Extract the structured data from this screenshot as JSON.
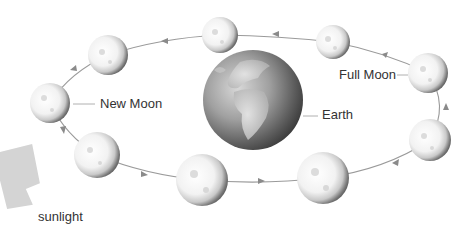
{
  "diagram": {
    "labels": {
      "new_moon": "New Moon",
      "full_moon": "Full Moon",
      "earth": "Earth",
      "sunlight": "sunlight"
    },
    "colors": {
      "background": "#ffffff",
      "orbit_line": "#9a9a9a",
      "sunlight_arrow": "#d4d4d4",
      "text": "#333333",
      "leader_line": "#b0b0b0"
    },
    "earth": {
      "cx": 253,
      "cy": 100,
      "r": 50
    },
    "moons": [
      {
        "id": "new-moon",
        "cx": 50,
        "cy": 103,
        "r": 20
      },
      {
        "id": "moon-2",
        "cx": 108,
        "cy": 55,
        "r": 20
      },
      {
        "id": "moon-3",
        "cx": 220,
        "cy": 35,
        "r": 18
      },
      {
        "id": "moon-4",
        "cx": 333,
        "cy": 42,
        "r": 17
      },
      {
        "id": "full-moon",
        "cx": 428,
        "cy": 73,
        "r": 20
      },
      {
        "id": "moon-6",
        "cx": 430,
        "cy": 140,
        "r": 21
      },
      {
        "id": "moon-7",
        "cx": 323,
        "cy": 178,
        "r": 26
      },
      {
        "id": "moon-8",
        "cx": 202,
        "cy": 180,
        "r": 26
      },
      {
        "id": "moon-9",
        "cx": 97,
        "cy": 155,
        "r": 23
      }
    ],
    "orbit_direction": "counter-clockwise"
  }
}
